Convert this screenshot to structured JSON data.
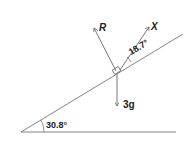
{
  "diagram": {
    "type": "inclined-plane force diagram",
    "incline_angle": "30.8°",
    "force_angle": "18.7°",
    "forces": {
      "normal": "R",
      "applied": "X",
      "weight": "3g"
    },
    "colors": {
      "line": "#555555",
      "text": "#222222"
    }
  }
}
